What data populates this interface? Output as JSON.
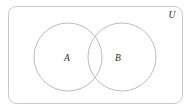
{
  "diagram": {
    "type": "venn-2-set",
    "title": "",
    "canvas": {
      "width": 192,
      "height": 110,
      "background": "#ffffff"
    },
    "universe": {
      "label": "U",
      "label_x": 172,
      "label_y": 18,
      "rect": {
        "x": 8.5,
        "y": 6.5,
        "width": 174,
        "height": 97,
        "rx": 8
      },
      "stroke": "#c9c9c9",
      "stroke_width": 1,
      "fill": "none"
    },
    "sets": [
      {
        "label": "A",
        "cx": 68,
        "cy": 57,
        "r": 34,
        "label_x": 67,
        "label_y": 60.5,
        "stroke": "#bdbdbd",
        "stroke_width": 1,
        "fill": "none"
      },
      {
        "label": "B",
        "cx": 122,
        "cy": 57,
        "r": 34,
        "label_x": 118,
        "label_y": 60.5,
        "stroke": "#bdbdbd",
        "stroke_width": 1,
        "fill": "none"
      }
    ],
    "colors": {
      "border": "#c9c9c9",
      "circle_stroke": "#bdbdbd",
      "text": "#2b2b2b",
      "background": "#ffffff"
    }
  }
}
